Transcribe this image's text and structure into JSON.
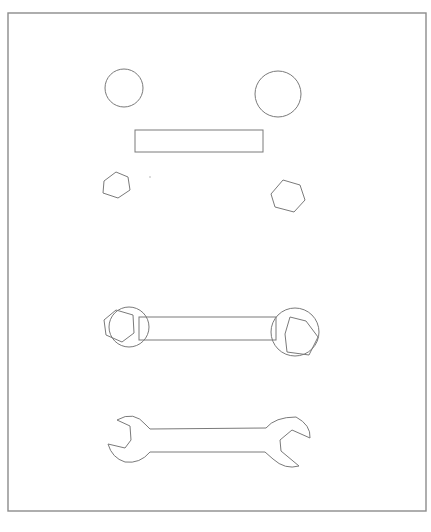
{
  "diagram": {
    "title": "",
    "colors": {
      "stroke": "#7a7a7a",
      "frame": "#8c8c8c",
      "background": "#ffffff"
    },
    "frame": {
      "x": 8,
      "y": 13,
      "width": 418,
      "height": 498
    },
    "stages": [
      {
        "name": "primitives",
        "circles": [
          {
            "cx": 124,
            "cy": 88,
            "r": 19
          },
          {
            "cx": 278,
            "cy": 94,
            "r": 23
          }
        ],
        "rects": [
          {
            "x": 135,
            "y": 130,
            "width": 128,
            "height": 22
          }
        ],
        "hexagons": [
          {
            "points": "104,181 116,172 128,177 130,190 118,198 103,193"
          },
          {
            "points": "271,194 283,180 300,185 305,200 294,212 275,207"
          }
        ],
        "dots": [
          {
            "cx": 150,
            "cy": 177,
            "r": 0.8
          }
        ]
      },
      {
        "name": "assembled",
        "circles": [
          {
            "cx": 129,
            "cy": 327,
            "r": 20
          },
          {
            "cx": 295,
            "cy": 332,
            "r": 24
          }
        ],
        "rects": [
          {
            "x": 139,
            "y": 317,
            "width": 137,
            "height": 23
          }
        ],
        "hexagons": [
          {
            "points": "104,320 116,310 133,315 134,333 122,342 106,335"
          },
          {
            "points": "285,334 290,317 306,321 318,337 309,355 287,352"
          }
        ]
      },
      {
        "name": "wrench-outline",
        "paths": [
          "M 117,420 Q 134,410 146,425 L 150,429 L 266,428 Q 275,417 296,417 Q 311,425 310,438 L 292,430 L 280,440 L 281,451 L 299,466 Q 285,470 273,459 L 265,452 L 150,452 Q 140,464 125,462 Q 112,458 108,444 L 125,448 L 131,440 L 130,426 Z"
        ]
      }
    ]
  }
}
